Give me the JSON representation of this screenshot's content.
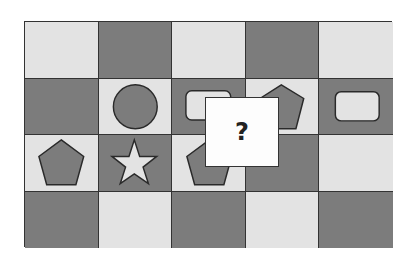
{
  "puzzle": {
    "rows": 4,
    "cols": 5,
    "colors": {
      "light": "#e3e3e3",
      "dark": "#7c7c7c",
      "border": "#333333",
      "overlay": "#fdfdfd"
    },
    "cells": [
      [
        {
          "shade": "light",
          "shape": null
        },
        {
          "shade": "dark",
          "shape": null
        },
        {
          "shade": "light",
          "shape": null
        },
        {
          "shade": "dark",
          "shape": null
        },
        {
          "shade": "light",
          "shape": null
        }
      ],
      [
        {
          "shade": "dark",
          "shape": null
        },
        {
          "shade": "light",
          "shape": "circle",
          "fill": "dark"
        },
        {
          "shade": "dark",
          "shape": "rounded-rectangle",
          "fill": "light"
        },
        {
          "shade": "light",
          "shape": "pentagon",
          "fill": "dark"
        },
        {
          "shade": "dark",
          "shape": "rounded-rectangle",
          "fill": "light"
        }
      ],
      [
        {
          "shade": "light",
          "shape": "pentagon",
          "fill": "dark"
        },
        {
          "shade": "dark",
          "shape": "star",
          "fill": "light"
        },
        {
          "shade": "light",
          "shape": "pentagon",
          "fill": "dark"
        },
        {
          "shade": "dark",
          "shape": null
        },
        {
          "shade": "light",
          "shape": null
        }
      ],
      [
        {
          "shade": "dark",
          "shape": null
        },
        {
          "shade": "light",
          "shape": null
        },
        {
          "shade": "dark",
          "shape": null
        },
        {
          "shade": "light",
          "shape": null
        },
        {
          "shade": "dark",
          "shape": null
        }
      ]
    ],
    "question_box": {
      "label": "?"
    }
  }
}
